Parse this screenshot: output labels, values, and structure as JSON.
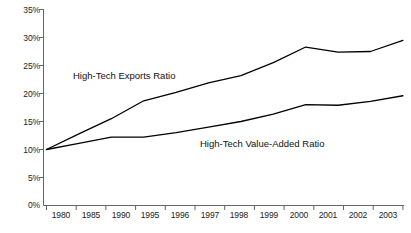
{
  "chart_data": {
    "type": "line",
    "title": "",
    "subtitle": "",
    "xlabel": "",
    "ylabel": "",
    "categories": [
      "1980",
      "1985",
      "1990",
      "1995",
      "1996",
      "1997",
      "1998",
      "1999",
      "2000",
      "2001",
      "2002",
      "2003"
    ],
    "ylim": [
      0,
      35
    ],
    "ytick_values": [
      0,
      5,
      10,
      15,
      20,
      25,
      30,
      35
    ],
    "ytick_labels": [
      "0%",
      "5%",
      "10%",
      "15%",
      "20%",
      "25%",
      "30%",
      "35%"
    ],
    "y_axis_unit": "%",
    "grid": false,
    "legend": "inline-annotations",
    "series": [
      {
        "name": "High-Tech Exports Ratio",
        "color": "#000000",
        "values": [
          10.0,
          12.8,
          15.5,
          18.7,
          20.2,
          21.9,
          23.2,
          25.5,
          28.3,
          27.4,
          27.5,
          29.5
        ]
      },
      {
        "name": "High-Tech Value-Added Ratio",
        "color": "#000000",
        "values": [
          10.0,
          11.1,
          12.2,
          12.2,
          13.0,
          14.0,
          15.0,
          16.3,
          18.0,
          17.9,
          18.6,
          19.6
        ]
      }
    ],
    "annotations": [
      {
        "text": "High-Tech Exports Ratio",
        "series": "High-Tech Exports Ratio"
      },
      {
        "text": "High-Tech Value-Added Ratio",
        "series": "High-Tech Value-Added Ratio"
      }
    ],
    "axis_color": "#555555",
    "line_color": "#000000"
  }
}
